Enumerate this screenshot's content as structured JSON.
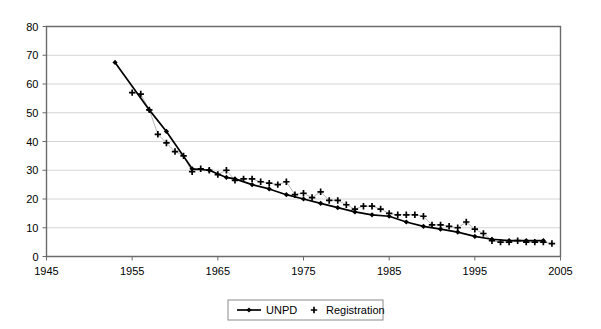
{
  "chart_data": {
    "type": "line",
    "title": "",
    "subtitle": "",
    "xlabel": "",
    "ylabel": "",
    "xlim": [
      1945,
      2005
    ],
    "ylim": [
      0,
      80
    ],
    "xticks": [
      1945,
      1955,
      1965,
      1975,
      1985,
      1995,
      2005
    ],
    "yticks": [
      0,
      10,
      20,
      30,
      40,
      50,
      60,
      70,
      80
    ],
    "grid": "horizontal",
    "legend_position": "bottom-center",
    "series": [
      {
        "name": "UNPD",
        "marker": "diamond",
        "line": "solid",
        "color": "#000000",
        "x": [
          1953,
          1957,
          1959,
          1962,
          1964,
          1966,
          1967,
          1969,
          1971,
          1973,
          1975,
          1977,
          1979,
          1981,
          1983,
          1985,
          1987,
          1989,
          1991,
          1993,
          1995,
          1997,
          1999,
          2001,
          2003
        ],
        "values": [
          67.5,
          51.0,
          43.5,
          30.5,
          30.0,
          27.5,
          27.0,
          25.0,
          23.5,
          21.5,
          20.0,
          18.5,
          17.0,
          15.5,
          14.5,
          14.0,
          12.0,
          10.5,
          9.5,
          8.5,
          7.0,
          6.0,
          5.5,
          5.5,
          5.5
        ]
      },
      {
        "name": "Registration",
        "marker": "plus",
        "line": "none",
        "color": "#000000",
        "x": [
          1955,
          1956,
          1957,
          1958,
          1959,
          1960,
          1961,
          1962,
          1963,
          1964,
          1965,
          1966,
          1967,
          1968,
          1969,
          1970,
          1971,
          1972,
          1973,
          1974,
          1975,
          1976,
          1977,
          1978,
          1979,
          1980,
          1981,
          1982,
          1983,
          1984,
          1985,
          1986,
          1987,
          1988,
          1989,
          1990,
          1991,
          1992,
          1993,
          1994,
          1995,
          1996,
          1997,
          1998,
          1999,
          2000,
          2001,
          2002,
          2003,
          2004
        ],
        "values": [
          57.0,
          56.5,
          51.0,
          42.5,
          39.5,
          36.5,
          35.0,
          29.5,
          30.5,
          30.0,
          28.5,
          30.0,
          26.5,
          27.0,
          27.0,
          26.0,
          25.5,
          25.0,
          26.0,
          21.5,
          22.0,
          20.5,
          22.5,
          19.5,
          19.5,
          18.0,
          16.5,
          17.5,
          17.5,
          16.5,
          15.0,
          14.5,
          14.5,
          14.5,
          14.0,
          11.0,
          11.0,
          10.5,
          10.0,
          12.0,
          9.5,
          8.0,
          5.5,
          5.0,
          5.0,
          5.5,
          5.0,
          5.0,
          5.0,
          4.5
        ]
      }
    ],
    "legend": [
      {
        "label": "UNPD",
        "marker": "line-diamond"
      },
      {
        "label": "Registration",
        "marker": "plus"
      }
    ]
  },
  "axis": {
    "x_tick_labels": [
      "1945",
      "1955",
      "1965",
      "1975",
      "1985",
      "1995",
      "2005"
    ],
    "y_tick_labels": [
      "0",
      "10",
      "20",
      "30",
      "40",
      "50",
      "60",
      "70",
      "80"
    ]
  },
  "colors": {
    "line": "#000000",
    "grid": "#d4d4d4",
    "axis": "#6b6b6b",
    "background": "#ffffff"
  }
}
